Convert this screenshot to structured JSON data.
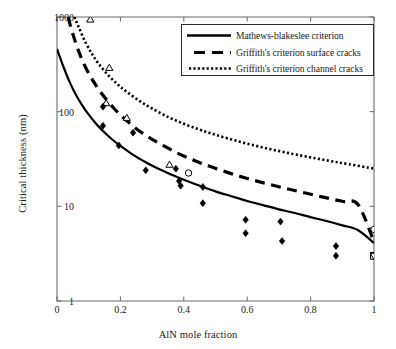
{
  "chart_data": {
    "type": "line",
    "title": "",
    "xlabel": "AlN mole fraction",
    "ylabel": "Critical thickness (nm)",
    "xlim": [
      0,
      1
    ],
    "ylim": [
      1,
      1000
    ],
    "yscale": "log",
    "xscale": "linear",
    "grid": false,
    "xticks": [
      "0",
      "0.2",
      "0.4",
      "0.6",
      "0.8",
      "1"
    ],
    "xtick_values": [
      0,
      0.2,
      0.4,
      0.6,
      0.8,
      1
    ],
    "yticks": [
      "1",
      "10",
      "100",
      "1000"
    ],
    "ytick_values": [
      1,
      10,
      100,
      1000
    ],
    "legend_position": "top-right",
    "series": [
      {
        "name": "Mathews-blakeslee criterion",
        "style": "solid",
        "color": "#000000",
        "x": [
          0.0,
          0.02,
          0.04,
          0.06,
          0.08,
          0.1,
          0.12,
          0.14,
          0.16,
          0.18,
          0.2,
          0.24,
          0.28,
          0.32,
          0.36,
          0.4,
          0.45,
          0.5,
          0.55,
          0.6,
          0.65,
          0.7,
          0.75,
          0.8,
          0.85,
          0.9,
          0.95,
          1.0
        ],
        "y": [
          460,
          300,
          205,
          150,
          116,
          93,
          77,
          65,
          56,
          49,
          43.5,
          35.0,
          29.2,
          24.9,
          21.7,
          19.1,
          16.5,
          14.4,
          12.8,
          11.4,
          10.3,
          9.3,
          8.5,
          7.7,
          7.0,
          6.3,
          5.6,
          4.1
        ]
      },
      {
        "name": "Griffith's criterion surface cracks",
        "style": "dashed",
        "color": "#000000",
        "x": [
          0.035,
          0.05,
          0.07,
          0.09,
          0.11,
          0.13,
          0.15,
          0.18,
          0.21,
          0.25,
          0.29,
          0.33,
          0.38,
          0.43,
          0.48,
          0.54,
          0.6,
          0.66,
          0.72,
          0.78,
          0.84,
          0.9,
          0.95,
          1.0
        ],
        "y": [
          1000,
          660,
          420,
          295,
          222,
          175,
          142,
          108,
          86,
          66,
          53.5,
          44.8,
          36.5,
          30.8,
          26.6,
          22.7,
          19.7,
          17.4,
          15.5,
          13.9,
          12.5,
          11.3,
          10.4,
          4.2
        ]
      },
      {
        "name": "Griffith's criterion channel cracks",
        "style": "dotted",
        "color": "#000000",
        "x": [
          0.055,
          0.07,
          0.09,
          0.11,
          0.13,
          0.16,
          0.19,
          0.22,
          0.26,
          0.3,
          0.35,
          0.4,
          0.45,
          0.5,
          0.56,
          0.62,
          0.68,
          0.74,
          0.8,
          0.86,
          0.92,
          1.0
        ],
        "y": [
          1000,
          760,
          540,
          410,
          325,
          246,
          196,
          162,
          130,
          108,
          88,
          74.5,
          64.5,
          57.0,
          49.8,
          44.2,
          39.7,
          36.0,
          32.9,
          30.2,
          27.9,
          25.0
        ]
      }
    ],
    "markers": [
      {
        "label": "open-triangle",
        "shape": "triangle",
        "fill": "none",
        "x": [
          0.105,
          0.165,
          0.155,
          0.22,
          0.355
        ],
        "y": [
          940,
          290,
          123,
          86,
          27.5
        ]
      },
      {
        "label": "filled-diamond",
        "shape": "diamond",
        "fill": "black",
        "x": [
          0.145,
          0.145,
          0.195,
          0.24,
          0.28,
          0.375,
          0.385,
          0.39,
          0.46,
          0.46,
          0.595,
          0.595,
          0.705,
          0.71,
          0.88,
          0.88
        ],
        "y": [
          113,
          71,
          44,
          60,
          24,
          25,
          18.5,
          16.5,
          16.0,
          10.8,
          7.2,
          5.2,
          6.9,
          4.3,
          3.8,
          3.0
        ]
      },
      {
        "label": "open-circle",
        "shape": "circle",
        "fill": "none",
        "x": [
          0.415,
          1.0
        ],
        "y": [
          22.5,
          5.7
        ]
      },
      {
        "label": "open-square",
        "shape": "square",
        "fill": "none",
        "x": [
          1.0
        ],
        "y": [
          3.0
        ]
      },
      {
        "label": "open-down-triangle",
        "shape": "triangle-down",
        "fill": "none",
        "x": [
          1.0
        ],
        "y": [
          3.0
        ]
      }
    ]
  },
  "legend": {
    "items": [
      {
        "label": "Mathews-blakeslee criterion",
        "style": "solid"
      },
      {
        "label": "Griffith's criterion surface cracks",
        "style": "dashed"
      },
      {
        "label": "Griffith's criterion channel cracks",
        "style": "dotted"
      }
    ]
  }
}
